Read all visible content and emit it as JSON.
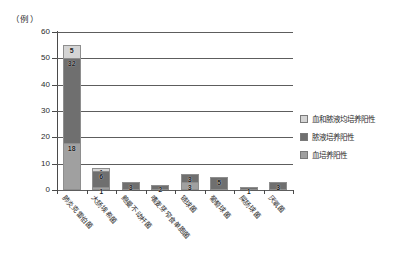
{
  "chart_data": {
    "type": "bar",
    "subtype": "stacked-vertical-bar",
    "title": "",
    "subtitle": "",
    "xlabel": "",
    "ylabel": "",
    "unit_label": "（例）",
    "ylim": [
      0,
      60
    ],
    "ytick_labels": [
      "0",
      "10",
      "20",
      "30",
      "40",
      "50",
      "60"
    ],
    "ytick_values": [
      0,
      10,
      20,
      30,
      40,
      50,
      60
    ],
    "grid": true,
    "grid_axis": "y",
    "legend_position": "right",
    "categories": [
      "肺炎克雷伯菌",
      "大肠埃希菌",
      "鲍曼不动杆菌",
      "嗜麦芽窄食单胞菌",
      "链球菌",
      "葡萄球菌",
      "屎肠球菌",
      "厌氧菌"
    ],
    "series": [
      {
        "name": "血培养阳性",
        "color": "#a0a0a0",
        "values": [
          18,
          1,
          0,
          0,
          3,
          0,
          0,
          0
        ],
        "labels": [
          "18",
          "1",
          "",
          "",
          "3",
          "",
          "",
          ""
        ]
      },
      {
        "name": "脓液培养阳性",
        "color": "#6f6f6f",
        "values": [
          32,
          6,
          3,
          2,
          3,
          5,
          1,
          3
        ],
        "labels": [
          "32",
          "6",
          "3",
          "2",
          "3",
          "5",
          "1",
          "3"
        ]
      },
      {
        "name": "血和脓液均培养阳性",
        "color": "#d4d4d4",
        "values": [
          5,
          1,
          0,
          0,
          0,
          0,
          0,
          0
        ],
        "labels": [
          "5",
          "1",
          "",
          "",
          "",
          "",
          "",
          ""
        ]
      }
    ],
    "totals": [
      55,
      8,
      3,
      2,
      6,
      5,
      1,
      3
    ]
  },
  "legend": {
    "entries": [
      {
        "label": "血和脓液均培养阳性",
        "color": "#d4d4d4"
      },
      {
        "label": "脓液培养阳性",
        "color": "#6f6f6f"
      },
      {
        "label": "血培养阳性",
        "color": "#a0a0a0"
      }
    ]
  }
}
